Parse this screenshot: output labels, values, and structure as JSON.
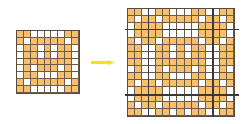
{
  "diagram": {
    "colors": {
      "filled": "#f8c06a",
      "empty": "#ffffff",
      "grid_line": "#6b5b4b",
      "tile_boundary": "#3a3a3a",
      "arrow": "#f5e11e"
    },
    "tile": {
      "size": 9,
      "pattern": [
        "OOWWWWWOO",
        "OWOOOOOWO",
        "WOOWOWOOW",
        "WOOWOWOOW",
        "WOOOOOOOW",
        "WOWOOOWOW",
        "WOOWWWOOW",
        "OWOOOOOWO",
        "OOWWWWWOO"
      ]
    },
    "tiled_view": {
      "size": 15,
      "offset": 3,
      "boundaries": [
        3,
        12
      ]
    },
    "arrow": {
      "direction": "right"
    }
  }
}
